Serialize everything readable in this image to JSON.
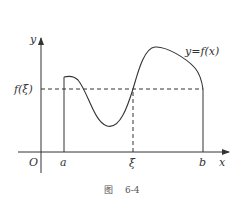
{
  "figure": {
    "caption_prefix": "图",
    "caption_number": "6-4"
  },
  "axes": {
    "x_label": "x",
    "y_label": "y",
    "origin_label": "O"
  },
  "labels": {
    "a": "a",
    "xi": "ξ",
    "b": "b",
    "f_xi": "f(ξ)",
    "curve": "y=f(x)"
  },
  "colors": {
    "line": "#333333",
    "text": "#333333"
  }
}
